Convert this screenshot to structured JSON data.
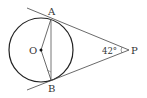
{
  "diagram": {
    "type": "geometry",
    "points": {
      "O": {
        "label": "O",
        "x": 41,
        "y": 50
      },
      "A": {
        "label": "A",
        "x": 51,
        "y": 19
      },
      "B": {
        "label": "B",
        "x": 51,
        "y": 80
      },
      "P": {
        "label": "P",
        "x": 129,
        "y": 50
      }
    },
    "circle": {
      "center": "O",
      "radius": 32
    },
    "segments": [
      "PA",
      "PB",
      "AB",
      "OA",
      "OB"
    ],
    "angle_label": {
      "vertex": "P",
      "text": "42°"
    },
    "colors": {
      "stroke": "#333333",
      "chord": "#777777",
      "background": "#ffffff"
    }
  }
}
